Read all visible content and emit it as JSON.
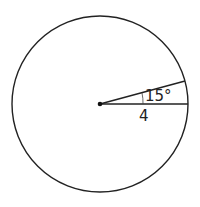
{
  "diagram": {
    "shape": "circle",
    "center": {
      "x": 100,
      "y": 104
    },
    "radius_px": 88,
    "stroke_color": "#222222",
    "radius_label": "4",
    "angle_label": "15°",
    "angle_degrees": 15
  }
}
